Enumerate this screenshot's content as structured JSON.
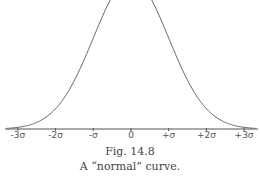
{
  "chart_data": {
    "type": "line",
    "title": "",
    "xlabel": "",
    "ylabel": "",
    "x": [
      -3,
      -2.5,
      -2,
      -1.5,
      -1,
      -0.5,
      0,
      0.5,
      1,
      1.5,
      2,
      2.5,
      3
    ],
    "series": [
      {
        "name": "normal curve",
        "values": [
          0.004,
          0.018,
          0.054,
          0.13,
          0.242,
          0.352,
          0.399,
          0.352,
          0.242,
          0.13,
          0.054,
          0.018,
          0.004
        ]
      }
    ],
    "tick_labels": [
      "-3σ",
      "-2σ",
      "-σ",
      "0",
      "+σ",
      "+2σ",
      "+3σ"
    ],
    "tick_values": [
      -3,
      -2,
      -1,
      0,
      1,
      2,
      3
    ],
    "grid": false,
    "legend": "none",
    "xlim": [
      -3.3,
      3.3
    ]
  },
  "caption": {
    "figure_number": "Fig. 14.8",
    "text": "A “normal” curve."
  },
  "style": {
    "curve_color": "#666666",
    "axis_color": "#555555"
  }
}
